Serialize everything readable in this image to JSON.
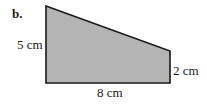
{
  "problem": {
    "part_label": "b."
  },
  "shape": {
    "type": "right-trapezoid",
    "fill_color": "#b4b4b4",
    "stroke_color": "#1a1a1a",
    "vertices": [
      [
        46,
        6
      ],
      [
        170,
        51
      ],
      [
        170,
        83
      ],
      [
        46,
        83
      ]
    ]
  },
  "dimensions": {
    "left_side": "5 cm",
    "right_side": "2 cm",
    "bottom_side": "8 cm"
  }
}
